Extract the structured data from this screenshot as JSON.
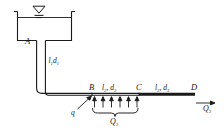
{
  "figure": {
    "type": "hydraulic-pipe-network-schematic",
    "background_color": "#ffffff",
    "line_color": "#1a1a1a"
  },
  "reservoir": {
    "name": "reservoir-tank",
    "water_level_symbol": "free-surface-triangle",
    "outlet_label": "A"
  },
  "pipes": [
    {
      "id": "vertical",
      "label_l": "l",
      "label_l_sub": "1",
      "label_d": "d",
      "label_d_sub": "1",
      "text": "l₁d₁"
    },
    {
      "id": "bc",
      "label_l": "l",
      "label_l_sub": "2",
      "label_d": "d",
      "label_d_sub": "2",
      "text": "l₂, d₂"
    },
    {
      "id": "cd",
      "label_l": "l",
      "label_l_sub": "3",
      "label_d": "d",
      "label_d_sub": "3",
      "text": "l₃, d₃"
    }
  ],
  "nodes": {
    "a": "A",
    "b": "B",
    "c": "C",
    "d": "D"
  },
  "labels": {
    "l1": "l",
    "l1_sub": "1",
    "d1": "d",
    "d1_sub": "1",
    "l2": "l",
    "l2_sub": "2",
    "d2": "d",
    "d2_sub": "2",
    "l3": "l",
    "l3_sub": "3",
    "d3": "d",
    "d3_sub": "3",
    "q_lateral": "q",
    "Q1": "Q",
    "Q1_sub": "1",
    "Q3": "Q",
    "Q3_sub": "3",
    "comma": ","
  },
  "flows": {
    "distributed_outflow_arrow_count": 6,
    "distributed_outflow_label": "Q₁",
    "lateral_inflow_label": "q",
    "discharge_label": "Q₃"
  }
}
